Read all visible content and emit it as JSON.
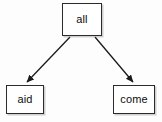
{
  "diagram": {
    "type": "tree",
    "title": "",
    "background_color": "#fdfdfd",
    "node_fill_color": "#ffffff",
    "node_border_color": "#2b2b2b",
    "edge_color": "#1a1a1a",
    "nodes": [
      {
        "id": "all",
        "label": "all",
        "role": "root"
      },
      {
        "id": "aid",
        "label": "aid",
        "role": "leaf"
      },
      {
        "id": "come",
        "label": "come",
        "role": "leaf"
      }
    ],
    "edges": [
      {
        "from": "all",
        "to": "aid",
        "label": "",
        "arrow": "arrowhead-icon"
      },
      {
        "from": "all",
        "to": "come",
        "label": "",
        "arrow": "arrowhead-icon"
      }
    ]
  }
}
